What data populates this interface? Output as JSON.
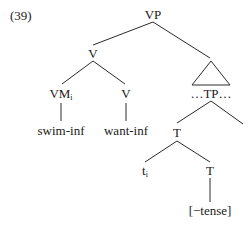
{
  "example": {
    "number": "(39)"
  },
  "tree": {
    "root": {
      "label": "VP"
    },
    "v_upper": {
      "label": "V"
    },
    "vm": {
      "label": "VM",
      "subscript": "i"
    },
    "v_lower": {
      "label": "V"
    },
    "swim": {
      "label": "swim-inf"
    },
    "want": {
      "label": "want-inf"
    },
    "tp": {
      "label": "…TP…",
      "shape": "triangle"
    },
    "t_upper": {
      "label": "T"
    },
    "trace": {
      "label": "t",
      "subscript": "i"
    },
    "t_lower": {
      "label": "T"
    },
    "feature": {
      "label": "[−tense]"
    }
  },
  "colors": {
    "ink": "#1a1a1a",
    "background": "#ffffff"
  }
}
